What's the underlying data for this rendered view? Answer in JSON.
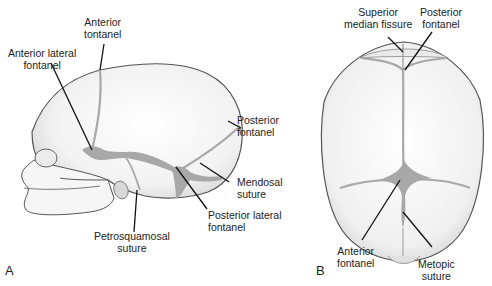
{
  "figure": {
    "panels": [
      {
        "id": "A",
        "letter": "A",
        "view": "lateral",
        "labels": [
          {
            "line1": "Anterior",
            "line2": "tontanel"
          },
          {
            "line1": "Anterior lateral",
            "line2": "fontanel"
          },
          {
            "line1": "Posterior",
            "line2": "fontanel"
          },
          {
            "line1": "Mendosal",
            "line2": "suture"
          },
          {
            "line1": "Posterior lateral",
            "line2": "fontanel"
          },
          {
            "line1": "Petrosquamosal",
            "line2": "suture"
          }
        ]
      },
      {
        "id": "B",
        "letter": "B",
        "view": "superior",
        "labels": [
          {
            "line1": "Superior",
            "line2": "median fissure"
          },
          {
            "line1": "Posterior",
            "line2": "fontanel"
          },
          {
            "line1": "Anterior",
            "line2": "fontanel"
          },
          {
            "line1": "Metopic",
            "line2": "suture"
          }
        ]
      }
    ],
    "colors": {
      "bone": "#f4f4f4",
      "outline": "#555555",
      "fontanel": "#a8a8a8",
      "leader": "#111111"
    }
  }
}
